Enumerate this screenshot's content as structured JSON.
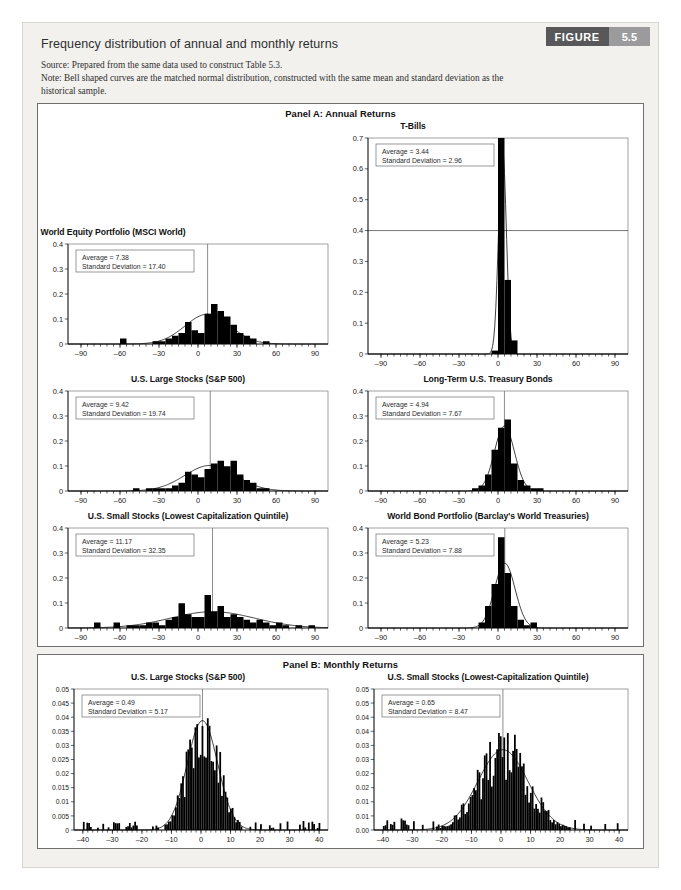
{
  "figure": {
    "title": "Frequency distribution of annual and monthly returns",
    "source_note": "Source: Prepared from the same data used to construct Table 5.3.",
    "bell_note": "Note: Bell shaped curves are the matched normal distribution, constructed with the same mean and standard deviation as the",
    "bell_note_cont": "historical sample.",
    "badge_word": "FIGURE",
    "badge_number": "5.5",
    "accent_dark": "#58585a",
    "accent_light": "#9b9b9d",
    "card_bg": "#f2f1ee"
  },
  "panelA": {
    "heading": "Panel A: Annual Returns"
  },
  "panelB": {
    "heading": "Panel B: Monthly Returns"
  },
  "labels": {
    "average_prefix": "Average = ",
    "sd_prefix": "Standard Deviation = "
  },
  "chart_data": [
    {
      "id": "world-equity-portfolio",
      "type": "bar",
      "panel": "A",
      "title": "World Equity Portfolio (MSCI World)",
      "average": 7.38,
      "standard_deviation": 17.4,
      "stat_average_label": "Average = 7.38",
      "stat_sd_label": "Standard Deviation = 17.40",
      "xlabel": "",
      "ylabel": "",
      "xlim": [
        -100,
        100
      ],
      "ylim": [
        0,
        0.4
      ],
      "xticks": [
        -90,
        -60,
        -30,
        0,
        30,
        60,
        90
      ],
      "xtick_labels": [
        "–90",
        "–60",
        "–30",
        "0",
        "30",
        "60",
        "90"
      ],
      "yticks": [
        0,
        0.1,
        0.2,
        0.3,
        0.4
      ],
      "ytick_labels": [
        "0",
        "0.1",
        "0.2",
        "0.3",
        "0.4"
      ],
      "bin_width": 5,
      "bin_centers": [
        -57.5,
        -52.5,
        -32.5,
        -27.5,
        -22.5,
        -17.5,
        -12.5,
        -7.5,
        -2.5,
        2.5,
        7.5,
        12.5,
        17.5,
        22.5,
        27.5,
        32.5,
        37.5,
        42.5,
        52.5
      ],
      "values": [
        0.022,
        0.0,
        0.011,
        0.011,
        0.022,
        0.033,
        0.044,
        0.088,
        0.055,
        0.044,
        0.121,
        0.16,
        0.132,
        0.11,
        0.077,
        0.044,
        0.033,
        0.022,
        0.011
      ],
      "grid": false,
      "legend": false
    },
    {
      "id": "t-bills",
      "type": "bar",
      "panel": "A",
      "title": "T-Bills",
      "average": 3.44,
      "standard_deviation": 2.96,
      "stat_average_label": "Average = 3.44",
      "stat_sd_label": "Standard Deviation = 2.96",
      "xlabel": "",
      "ylabel": "",
      "xlim": [
        -100,
        100
      ],
      "ylim": [
        0,
        0.7
      ],
      "xticks": [
        -90,
        -60,
        -30,
        0,
        30,
        60,
        90
      ],
      "xtick_labels": [
        "–90",
        "–60",
        "–30",
        "0",
        "30",
        "60",
        "90"
      ],
      "yticks": [
        0,
        0.1,
        0.2,
        0.3,
        0.4,
        0.5,
        0.6,
        0.7
      ],
      "ytick_labels": [
        "0",
        "0.1",
        "0.2",
        "0.3",
        "0.4",
        "0.5",
        "0.6",
        "0.7"
      ],
      "bin_width": 5,
      "bin_centers": [
        -2.5,
        2.5,
        7.5,
        12.5
      ],
      "values": [
        0.011,
        0.703,
        0.24,
        0.044
      ],
      "grid": false,
      "legend": false,
      "stray_hline_y": 0.4
    },
    {
      "id": "us-large-stocks-annual",
      "type": "bar",
      "panel": "A",
      "title": "U.S. Large Stocks (S&P 500)",
      "average": 9.42,
      "standard_deviation": 19.74,
      "stat_average_label": "Average = 9.42",
      "stat_sd_label": "Standard Deviation = 19.74",
      "xlabel": "",
      "ylabel": "",
      "xlim": [
        -100,
        100
      ],
      "ylim": [
        0,
        0.4
      ],
      "xticks": [
        -90,
        -60,
        -30,
        0,
        30,
        60,
        90
      ],
      "xtick_labels": [
        "–90",
        "–60",
        "–30",
        "0",
        "30",
        "60",
        "90"
      ],
      "yticks": [
        0,
        0.1,
        0.2,
        0.3,
        0.4
      ],
      "ytick_labels": [
        "0",
        "0.1",
        "0.2",
        "0.3",
        "0.4"
      ],
      "bin_width": 5,
      "bin_centers": [
        -47.5,
        -42.5,
        -37.5,
        -32.5,
        -27.5,
        -22.5,
        -17.5,
        -12.5,
        -7.5,
        -2.5,
        2.5,
        7.5,
        12.5,
        17.5,
        22.5,
        27.5,
        32.5,
        37.5,
        42.5,
        47.5,
        52.5
      ],
      "values": [
        0.011,
        0.0,
        0.011,
        0.011,
        0.011,
        0.011,
        0.022,
        0.033,
        0.077,
        0.066,
        0.055,
        0.088,
        0.11,
        0.121,
        0.099,
        0.121,
        0.066,
        0.044,
        0.033,
        0.011,
        0.011
      ],
      "grid": false,
      "legend": false
    },
    {
      "id": "long-term-treasury-bonds",
      "type": "bar",
      "panel": "A",
      "title": "Long-Term U.S. Treasury Bonds",
      "average": 4.94,
      "standard_deviation": 7.67,
      "stat_average_label": "Average = 4.94",
      "stat_sd_label": "Standard Deviation = 7.67",
      "xlabel": "",
      "ylabel": "",
      "xlim": [
        -100,
        100
      ],
      "ylim": [
        0,
        0.4
      ],
      "xticks": [
        -90,
        -60,
        -30,
        0,
        30,
        60,
        90
      ],
      "xtick_labels": [
        "–90",
        "–60",
        "–30",
        "0",
        "30",
        "60",
        "90"
      ],
      "yticks": [
        0,
        0.1,
        0.2,
        0.3,
        0.4
      ],
      "ytick_labels": [
        "0",
        "0.1",
        "0.2",
        "0.3",
        "0.4"
      ],
      "bin_width": 5,
      "bin_centers": [
        -17.5,
        -12.5,
        -7.5,
        -2.5,
        2.5,
        7.5,
        12.5,
        17.5,
        22.5,
        27.5,
        32.5
      ],
      "values": [
        0.011,
        0.022,
        0.066,
        0.165,
        0.253,
        0.286,
        0.11,
        0.044,
        0.022,
        0.011,
        0.011
      ],
      "grid": false,
      "legend": false
    },
    {
      "id": "us-small-stocks-annual",
      "type": "bar",
      "panel": "A",
      "title": "U.S. Small Stocks (Lowest Capitalization Quintile)",
      "average": 11.17,
      "standard_deviation": 32.35,
      "stat_average_label": "Average = 11.17",
      "stat_sd_label": "Standard Deviation = 32.35",
      "xlabel": "",
      "ylabel": "",
      "xlim": [
        -100,
        100
      ],
      "ylim": [
        0,
        0.4
      ],
      "xticks": [
        -90,
        -60,
        -30,
        0,
        30,
        60,
        90
      ],
      "xtick_labels": [
        "–90",
        "–60",
        "–30",
        "0",
        "30",
        "60",
        "90"
      ],
      "yticks": [
        0,
        0.1,
        0.2,
        0.3,
        0.4
      ],
      "ytick_labels": [
        "0",
        "0.1",
        "0.2",
        "0.3",
        "0.4"
      ],
      "bin_width": 5,
      "bin_centers": [
        -77.5,
        -62.5,
        -52.5,
        -47.5,
        -42.5,
        -37.5,
        -32.5,
        -27.5,
        -22.5,
        -17.5,
        -12.5,
        -7.5,
        -2.5,
        2.5,
        7.5,
        12.5,
        17.5,
        22.5,
        27.5,
        32.5,
        37.5,
        42.5,
        47.5,
        52.5,
        57.5,
        62.5,
        67.5,
        77.5,
        87.5
      ],
      "values": [
        0.022,
        0.022,
        0.011,
        0.011,
        0.011,
        0.022,
        0.022,
        0.011,
        0.033,
        0.044,
        0.099,
        0.055,
        0.044,
        0.044,
        0.132,
        0.066,
        0.088,
        0.044,
        0.055,
        0.044,
        0.033,
        0.022,
        0.033,
        0.022,
        0.011,
        0.022,
        0.011,
        0.011,
        0.011
      ],
      "grid": false,
      "legend": false
    },
    {
      "id": "world-bond-portfolio",
      "type": "bar",
      "panel": "A",
      "title": "World Bond Portfolio (Barclay's World Treasuries)",
      "average": 5.23,
      "standard_deviation": 7.88,
      "stat_average_label": "Average = 5.23",
      "stat_sd_label": "Standard Deviation = 7.88",
      "xlabel": "",
      "ylabel": "",
      "xlim": [
        -100,
        100
      ],
      "ylim": [
        0,
        0.4
      ],
      "xticks": [
        -90,
        -60,
        -30,
        0,
        30,
        60,
        90
      ],
      "xtick_labels": [
        "–90",
        "–60",
        "–30",
        "0",
        "30",
        "60",
        "90"
      ],
      "yticks": [
        0,
        0.1,
        0.2,
        0.3,
        0.4
      ],
      "ytick_labels": [
        "0",
        "0.1",
        "0.2",
        "0.3",
        "0.4"
      ],
      "bin_width": 5,
      "bin_centers": [
        -12.5,
        -7.5,
        -2.5,
        2.5,
        7.5,
        12.5,
        17.5,
        22.5,
        27.5
      ],
      "values": [
        0.022,
        0.088,
        0.176,
        0.363,
        0.22,
        0.088,
        0.033,
        0.011,
        0.022
      ],
      "grid": false,
      "legend": false
    },
    {
      "id": "us-large-stocks-monthly",
      "type": "bar",
      "panel": "B",
      "title": "U.S. Large Stocks (S&P 500)",
      "average": 0.49,
      "standard_deviation": 5.17,
      "stat_average_label": "Average = 0.49",
      "stat_sd_label": "Standard Deviation = 5.17",
      "xlabel": "",
      "ylabel": "",
      "xlim": [
        -43,
        43
      ],
      "ylim": [
        0,
        0.05
      ],
      "xticks": [
        -40,
        -30,
        -20,
        -10,
        0,
        10,
        20,
        30,
        40
      ],
      "xtick_labels": [
        "–40",
        "–30",
        "–20",
        "–10",
        "0",
        "10",
        "20",
        "30",
        "40"
      ],
      "yticks": [
        0,
        0.005,
        0.01,
        0.015,
        0.02,
        0.025,
        0.03,
        0.035,
        0.04,
        0.045,
        0.05
      ],
      "ytick_labels": [
        "0",
        "0.005",
        "0.01",
        "0.015",
        "0.02",
        "0.025",
        "0.03",
        "0.035",
        "0.04",
        "0.045",
        "0.05"
      ],
      "bin_width": 0.6,
      "grid": false,
      "legend": false,
      "generator": {
        "mode": "normal-jitter",
        "mean": 0.49,
        "sd": 5.17,
        "peak": 0.036,
        "seed": 17,
        "xmin": -40,
        "xmax": 40,
        "noise": 0.38,
        "tail": 0.0016
      }
    },
    {
      "id": "us-small-stocks-monthly",
      "type": "bar",
      "panel": "B",
      "title": "U.S. Small Stocks (Lowest-Capitalization Quintile)",
      "average": 0.65,
      "standard_deviation": 8.47,
      "stat_average_label": "Average = 0.65",
      "stat_sd_label": "Standard Deviation = 8.47",
      "xlabel": "",
      "ylabel": "",
      "xlim": [
        -43,
        43
      ],
      "ylim": [
        0,
        0.05
      ],
      "xticks": [
        -40,
        -30,
        -20,
        -10,
        0,
        10,
        20,
        30,
        40
      ],
      "xtick_labels": [
        "–40",
        "–30",
        "–20",
        "–10",
        "0",
        "10",
        "20",
        "30",
        "40"
      ],
      "yticks": [
        0,
        0.005,
        0.01,
        0.015,
        0.02,
        0.025,
        0.03,
        0.035,
        0.04,
        0.045,
        0.05
      ],
      "ytick_labels": [
        "0.00",
        "0.01",
        "0.01",
        "0.02",
        "0.02",
        "0.03",
        "0.03",
        "0.04",
        "0.04",
        "0.05",
        "0.05"
      ],
      "bin_width": 0.6,
      "grid": false,
      "legend": false,
      "generator": {
        "mode": "normal-jitter",
        "mean": 0.65,
        "sd": 8.47,
        "peak": 0.0255,
        "seed": 43,
        "xmin": -40,
        "xmax": 40,
        "noise": 0.42,
        "tail": 0.002
      }
    }
  ]
}
